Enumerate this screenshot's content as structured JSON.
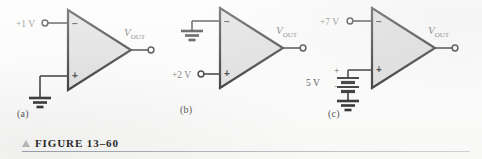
{
  "figure": {
    "caption_marker": "triangle-up-icon",
    "caption_text": "FIGURE 13–60"
  },
  "circuits": [
    {
      "id": "a",
      "sublabel": "(a)",
      "inverting_input": {
        "pin_symbol": "−",
        "source_label": "+1 V",
        "terminal": "open-circle"
      },
      "noninverting_input": {
        "pin_symbol": "+",
        "source_label": "",
        "connection": "ground"
      },
      "output": {
        "label_v": "V",
        "label_sub": "OUT",
        "terminal": "open-circle"
      }
    },
    {
      "id": "b",
      "sublabel": "(b)",
      "inverting_input": {
        "pin_symbol": "−",
        "source_label": "",
        "connection": "ground"
      },
      "noninverting_input": {
        "pin_symbol": "+",
        "source_label": "+2 V",
        "terminal": "open-circle"
      },
      "output": {
        "label_v": "V",
        "label_sub": "OUT",
        "terminal": "open-circle"
      }
    },
    {
      "id": "c",
      "sublabel": "(c)",
      "inverting_input": {
        "pin_symbol": "−",
        "source_label": "+7 V",
        "terminal": "open-circle"
      },
      "noninverting_input": {
        "pin_symbol": "+",
        "source_label": "",
        "connection": "battery"
      },
      "battery": {
        "value_label": "5 V",
        "positive_symbol": "+",
        "negative_symbol": "−",
        "returns_to": "ground"
      },
      "output": {
        "label_v": "V",
        "label_sub": "OUT",
        "terminal": "open-circle"
      }
    }
  ],
  "colors": {
    "page_background": "#fbfbfa",
    "opamp_fill": "#d8d8d8",
    "wire": "#1a1a1a",
    "label_gray": "#5c5c5c",
    "rule": "#9aa3ad"
  }
}
